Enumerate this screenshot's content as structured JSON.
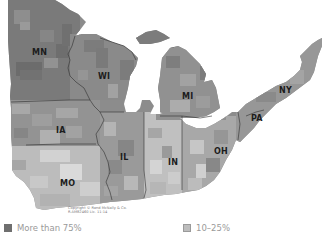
{
  "map": {
    "type": "choropleth",
    "region": "Midwest / Great Lakes United States",
    "states": [
      {
        "abbr": "MN",
        "x": 32,
        "y": 55
      },
      {
        "abbr": "WI",
        "x": 98,
        "y": 79
      },
      {
        "abbr": "MI",
        "x": 182,
        "y": 99
      },
      {
        "abbr": "NY",
        "x": 279,
        "y": 93
      },
      {
        "abbr": "PA",
        "x": 253,
        "y": 119
      },
      {
        "abbr": "IA",
        "x": 56,
        "y": 133
      },
      {
        "abbr": "IL",
        "x": 120,
        "y": 161
      },
      {
        "abbr": "IN",
        "x": 168,
        "y": 165
      },
      {
        "abbr": "OH",
        "x": 214,
        "y": 154
      },
      {
        "abbr": "MO",
        "x": 62,
        "y": 185
      }
    ],
    "copyright_line1": "Copyright © Rand McNally & Co.",
    "copyright_line2": "R.AM82460 Lic. 11-14",
    "colors": {
      "more_than_75": "#6f6f6f",
      "50_75": "#8c8c8c",
      "25_50": "#a9a9a9",
      "10_25": "#c4c4c4",
      "less_than_10": "#dedede",
      "border": "#3a3a3a",
      "water": "#ffffff"
    }
  },
  "legend": {
    "items": [
      {
        "label": "More than 75%",
        "color": "#6f6f6f"
      },
      {
        "label": "10–25%",
        "color": "#bdbdbd"
      }
    ]
  }
}
